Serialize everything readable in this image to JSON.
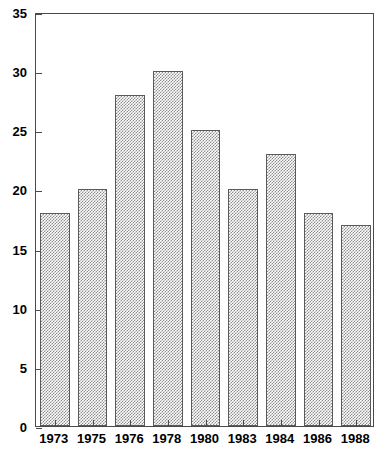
{
  "chart_data": {
    "type": "bar",
    "title": "",
    "subtitle": "",
    "xlabel": "",
    "ylabel": "",
    "categories": [
      "1973",
      "1975",
      "1976",
      "1978",
      "1980",
      "1983",
      "1984",
      "1986",
      "1988"
    ],
    "values": [
      18,
      20,
      28,
      30,
      25,
      20,
      23,
      18,
      17
    ],
    "ylim": [
      0,
      35
    ],
    "xlim": [
      0,
      9
    ],
    "y_ticks": [
      0,
      5,
      10,
      15,
      20,
      25,
      30,
      35
    ],
    "y_ticklabels": [
      "0",
      "5",
      "10",
      "15",
      "20",
      "25",
      "30",
      "35"
    ],
    "x_ticklabels": [
      "1973",
      "1975",
      "1976",
      "1978",
      "1980",
      "1983",
      "1984",
      "1986",
      "1988"
    ],
    "grid": false,
    "legend": null,
    "legend_position": "none",
    "annotations": [],
    "style": {
      "bar_fill": "#8d8d8d",
      "bar_fill_pattern": "fine-dither-checkerboard",
      "bar_edge": "#5a5a5a",
      "axis_color": "#4a4a4a",
      "background": "#ffffff",
      "text_color": "#000000"
    }
  }
}
